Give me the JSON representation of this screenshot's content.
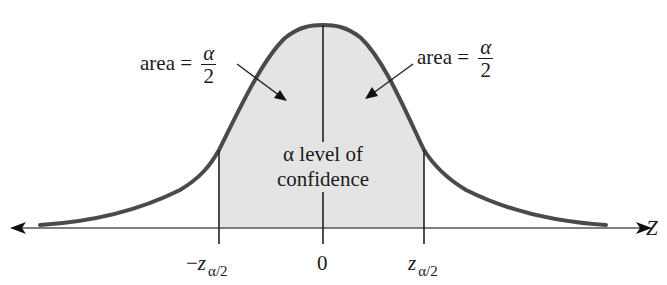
{
  "figure": {
    "axis_label": "Z",
    "left_area_label": {
      "prefix": "area =",
      "numerator": "α",
      "denominator": "2"
    },
    "right_area_label": {
      "prefix": "area =",
      "numerator": "α",
      "denominator": "2"
    },
    "center_label_line1": "α level of",
    "center_label_line2": "confidence",
    "ticks": [
      {
        "sign": "−",
        "var": "z",
        "sub": "α/2"
      },
      {
        "value": "0"
      },
      {
        "sign": "",
        "var": "z",
        "sub": "α/2"
      }
    ],
    "colors": {
      "curve": "#4a4a4a",
      "shade": "#e4e4e4",
      "lines": "#222222"
    }
  }
}
